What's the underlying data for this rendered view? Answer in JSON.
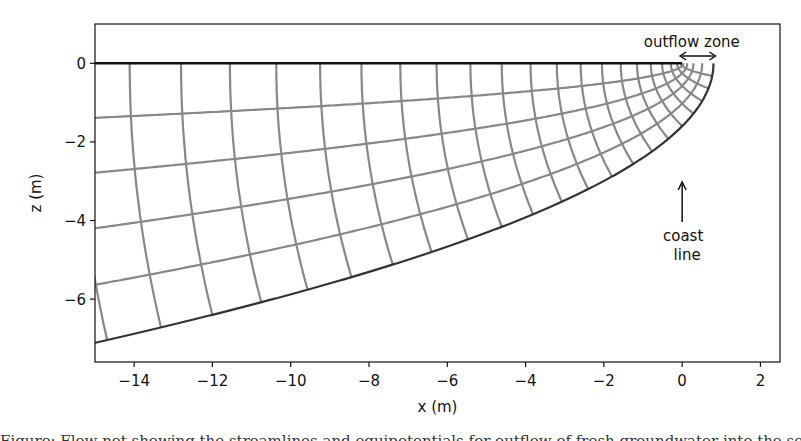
{
  "chart_data": {
    "type": "line",
    "title": "",
    "xlabel": "x (m)",
    "ylabel": "z (m)",
    "xlim": [
      -15,
      2.5
    ],
    "ylim": [
      -7.6,
      1.0
    ],
    "xticks": [
      -14,
      -12,
      -10,
      -8,
      -6,
      -4,
      -2,
      0,
      2
    ],
    "xtick_labels": [
      "−14",
      "−12",
      "−10",
      "−8",
      "−6",
      "−4",
      "−2",
      "0",
      "2"
    ],
    "yticks": [
      0,
      -2,
      -4,
      -6
    ],
    "ytick_labels": [
      "0",
      "−2",
      "−4",
      "−6"
    ],
    "grid": false,
    "legend": null,
    "interface": {
      "form": "x = 0.8 - z^2 / 3.2",
      "tip_x": 0.8,
      "depth_at_x_-15": -7.1,
      "color": "#333333"
    },
    "top_boundary": {
      "z": 0,
      "x_range": [
        -15,
        0
      ],
      "color": "#111111"
    },
    "flow_net": {
      "coordinates": "parabolic: -x = (s^2 - t^2)/2, -z = s*t",
      "t_max": 1.2649,
      "t_divisions": 5,
      "s_step": 0.253,
      "line_color": "#888888"
    },
    "annotations": [
      {
        "text": "outflow zone",
        "x": 0.4,
        "z": 0.45,
        "arrow": "double-headed from x=0 to x=0.8 at z=0.2"
      },
      {
        "text": "coast\nline",
        "x": 0,
        "z": -4.6,
        "arrow": "up, from z=-4.05 to z=-3.0 at x=0"
      }
    ]
  },
  "figure": {
    "xlabel": "x (m)",
    "ylabel": "z (m)",
    "annotation_outflow": "outflow zone",
    "annotation_coast_1": "coast",
    "annotation_coast_2": "line",
    "caption_partial": "Figure: Flow net showing the streamlines and equipotentials for outflow of fresh groundwater into the sea (Glover's solution)"
  }
}
